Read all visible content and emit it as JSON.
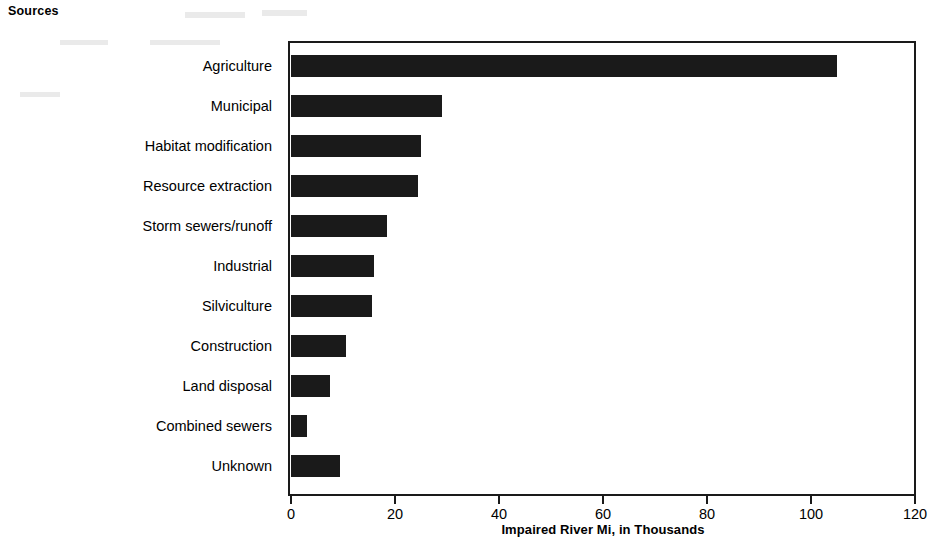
{
  "figure": {
    "corner_title": "Sources",
    "background_color": "#ffffff",
    "bar_color": "#1a1a1a",
    "axis_color": "#1a1a1a"
  },
  "chart_data": {
    "type": "bar",
    "orientation": "horizontal",
    "title": "Sources",
    "xlabel": "Impaired River Mi, in Thousands",
    "ylabel": "",
    "xlim": [
      0,
      120
    ],
    "xticks": [
      0,
      20,
      40,
      60,
      80,
      100,
      120
    ],
    "xtick_labels": [
      "0",
      "20",
      "40",
      "60",
      "80",
      "100",
      "120"
    ],
    "grid": false,
    "legend": null,
    "categories": [
      "Agriculture",
      "Municipal",
      "Habitat modification",
      "Resource extraction",
      "Storm sewers/runoff",
      "Industrial",
      "Silviculture",
      "Construction",
      "Land disposal",
      "Combined sewers",
      "Unknown"
    ],
    "values": [
      105,
      29,
      25,
      24.5,
      18.5,
      16,
      15.5,
      10.5,
      7.5,
      3,
      9.5
    ],
    "bars": [
      {
        "label": "Agriculture",
        "value": 105
      },
      {
        "label": "Municipal",
        "value": 29
      },
      {
        "label": "Habitat modification",
        "value": 25
      },
      {
        "label": "Resource extraction",
        "value": 24.5
      },
      {
        "label": "Storm sewers/runoff",
        "value": 18.5
      },
      {
        "label": "Industrial",
        "value": 16
      },
      {
        "label": "Silviculture",
        "value": 15.5
      },
      {
        "label": "Construction",
        "value": 10.5
      },
      {
        "label": "Land disposal",
        "value": 7.5
      },
      {
        "label": "Combined sewers",
        "value": 3
      },
      {
        "label": "Unknown",
        "value": 9.5
      }
    ]
  }
}
